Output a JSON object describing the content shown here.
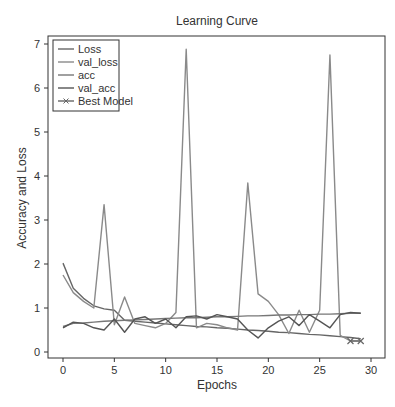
{
  "chart_data": {
    "type": "line",
    "title": "Learning Curve",
    "xlabel": "Epochs",
    "ylabel": "Accuracy and Loss",
    "xlim": [
      -1.5,
      30.3
    ],
    "ylim": [
      -0.15,
      7.2
    ],
    "xticks": [
      0,
      5,
      10,
      15,
      20,
      25,
      30
    ],
    "yticks": [
      0,
      1,
      2,
      3,
      4,
      5,
      6,
      7
    ],
    "grid": false,
    "legend_position": "upper left",
    "x": [
      0,
      1,
      2,
      3,
      4,
      5,
      6,
      7,
      8,
      9,
      10,
      11,
      12,
      13,
      14,
      15,
      16,
      17,
      18,
      19,
      20,
      21,
      22,
      23,
      24,
      25,
      26,
      27,
      28,
      29
    ],
    "series": [
      {
        "name": "Loss",
        "color": "#666666",
        "values": [
          2.02,
          1.45,
          1.22,
          1.05,
          0.98,
          0.95,
          0.72,
          0.7,
          0.68,
          0.66,
          0.64,
          0.62,
          0.6,
          0.58,
          0.57,
          0.55,
          0.54,
          0.52,
          0.5,
          0.49,
          0.47,
          0.45,
          0.44,
          0.42,
          0.4,
          0.39,
          0.37,
          0.35,
          0.33,
          0.3
        ]
      },
      {
        "name": "val_loss",
        "color": "#8a8a8a",
        "values": [
          1.75,
          1.35,
          1.15,
          1.0,
          3.35,
          0.62,
          1.25,
          0.65,
          0.6,
          0.55,
          0.65,
          0.9,
          6.88,
          0.55,
          0.65,
          0.62,
          0.55,
          0.5,
          3.84,
          1.32,
          1.15,
          0.85,
          0.42,
          0.95,
          0.45,
          0.95,
          6.75,
          0.38,
          0.25,
          0.25
        ]
      },
      {
        "name": "acc",
        "color": "#777777",
        "values": [
          0.58,
          0.65,
          0.66,
          0.68,
          0.7,
          0.71,
          0.72,
          0.73,
          0.74,
          0.75,
          0.76,
          0.77,
          0.78,
          0.78,
          0.79,
          0.8,
          0.8,
          0.81,
          0.82,
          0.82,
          0.83,
          0.84,
          0.84,
          0.85,
          0.85,
          0.86,
          0.86,
          0.87,
          0.88,
          0.88
        ]
      },
      {
        "name": "val_acc",
        "color": "#555555",
        "values": [
          0.55,
          0.68,
          0.65,
          0.55,
          0.5,
          0.75,
          0.45,
          0.75,
          0.8,
          0.65,
          0.75,
          0.55,
          0.8,
          0.82,
          0.75,
          0.85,
          0.8,
          0.75,
          0.5,
          0.32,
          0.55,
          0.7,
          0.8,
          0.6,
          0.85,
          0.7,
          0.55,
          0.85,
          0.9,
          0.88
        ]
      }
    ],
    "annotations": [
      {
        "name": "Best Model",
        "marker": "x",
        "x": [
          28,
          29
        ],
        "y": [
          0.25,
          0.25
        ],
        "color": "#666666"
      }
    ]
  },
  "legend": {
    "items": [
      {
        "label": "Loss",
        "color": "#666666",
        "marker": "none"
      },
      {
        "label": "val_loss",
        "color": "#8a8a8a",
        "marker": "none"
      },
      {
        "label": "acc",
        "color": "#777777",
        "marker": "none"
      },
      {
        "label": "val_acc",
        "color": "#555555",
        "marker": "none"
      },
      {
        "label": "Best Model",
        "color": "#666666",
        "marker": "x"
      }
    ]
  }
}
